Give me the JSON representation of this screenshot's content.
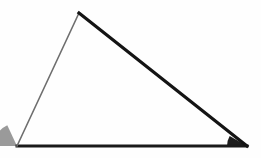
{
  "figure": {
    "type": "geometry-diagram",
    "shape": "triangle",
    "classification": "scalene-obtuse",
    "background_color": "#fefefe",
    "canvas": {
      "width": 261,
      "height": 158
    }
  },
  "chart_data": {
    "type": "diagram",
    "title": "",
    "vertices": [
      {
        "name": "apex",
        "label": "",
        "x": 79,
        "y": 13
      },
      {
        "name": "bottom-left",
        "label": "",
        "x": 17,
        "y": 146
      },
      {
        "name": "bottom-right",
        "label": "",
        "x": 247,
        "y": 146
      }
    ],
    "edges": [
      {
        "name": "left-side",
        "from": "bottom-left",
        "to": "apex",
        "color": "#6e6e6e",
        "stroke_width": 1.6
      },
      {
        "name": "hypotenuse",
        "from": "apex",
        "to": "bottom-right",
        "color": "#141414",
        "stroke_width": 3.2
      },
      {
        "name": "base",
        "from": "bottom-left",
        "to": "bottom-right",
        "color": "#1a1a1a",
        "stroke_width": 3.0
      }
    ],
    "angle_markers": [
      {
        "name": "left-angle-wedge",
        "at_vertex": "bottom-left",
        "fill": "#9a9a9a",
        "radius": 23,
        "start_deg": 180,
        "end_deg": 115,
        "shaded": true
      },
      {
        "name": "right-angle-wedge",
        "at_vertex": "bottom-right",
        "fill": "#1d1d1d",
        "radius": 20,
        "start_deg": 180,
        "end_deg": 150,
        "shaded": true
      }
    ],
    "labels": [],
    "grid": false,
    "legend": null
  }
}
